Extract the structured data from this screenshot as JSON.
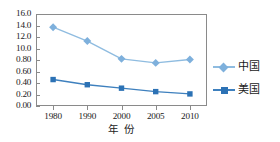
{
  "chart_data": {
    "type": "line",
    "title": "",
    "subtitle": "",
    "xlabel": "年 份",
    "ylabel": "",
    "x": [
      1980,
      1990,
      2000,
      2005,
      2010
    ],
    "categories": [
      "1980",
      "1990",
      "2000",
      "2005",
      "2010"
    ],
    "xtick_labels": [
      "1980",
      "1990",
      "2000",
      "2005",
      "2010"
    ],
    "ytick_labels": [
      "16.0",
      "14.0",
      "12.0",
      "10.0",
      "0.80",
      "0.60",
      "0.40",
      "0.20",
      "0.00"
    ],
    "ytick_values": [
      1.6,
      1.4,
      1.2,
      1.0,
      0.8,
      0.6,
      0.4,
      0.2,
      0.0
    ],
    "ylim": [
      0.0,
      1.6
    ],
    "grid": false,
    "legend_position": "right",
    "series": [
      {
        "name": "中国",
        "marker": "diamond",
        "color": "#7EB0DC",
        "line_color": "#8FBCE0",
        "values": [
          1.37,
          1.13,
          0.82,
          0.75,
          0.81
        ]
      },
      {
        "name": "美国",
        "marker": "square",
        "color": "#2C72B5",
        "line_color": "#3E80BE",
        "values": [
          0.46,
          0.37,
          0.31,
          0.25,
          0.21
        ]
      }
    ]
  },
  "legend": {
    "items": [
      {
        "label": "中国"
      },
      {
        "label": "美国"
      }
    ]
  },
  "axis": {
    "x_title": "年 份"
  },
  "colors": {
    "china": "#7EB0DC",
    "usa": "#2C72B5",
    "frame": "#8a8a8a",
    "text": "#1a1a1a",
    "background": "#ffffff"
  }
}
